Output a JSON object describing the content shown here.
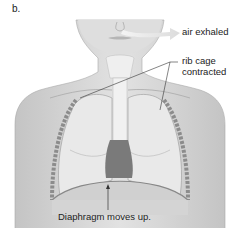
{
  "figure": {
    "panel_letter": "b.",
    "labels": {
      "air": "air exhaled",
      "rib_line1": "rib cage",
      "rib_line2": "contracted",
      "diaphragm": "Diaphragm moves up."
    },
    "colors": {
      "skin": "#d9d9d9",
      "skin_shadow": "#b8b8b8",
      "lung": "#e8e8e8",
      "rib": "#a0a0a0",
      "trachea": "#f0f0f0",
      "heart": "#6e6e6e",
      "line": "#333333",
      "air_arrow": "#e6e6e6"
    }
  }
}
